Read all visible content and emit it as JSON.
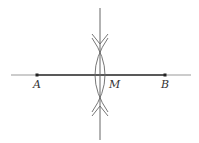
{
  "diagram": {
    "points": [
      {
        "name": "A",
        "label": "A",
        "x": 37,
        "y": 75
      },
      {
        "name": "B",
        "label": "B",
        "x": 165,
        "y": 75
      },
      {
        "name": "M",
        "label": "M",
        "x": 100,
        "y": 75
      }
    ],
    "segment": {
      "from": "A",
      "to": "B"
    },
    "line": {
      "x1": 11,
      "y1": 75,
      "x2": 191,
      "y2": 75
    },
    "bisector": {
      "x": 100,
      "y1": 8,
      "y2": 140
    },
    "arc_intersections": [
      {
        "x": 100,
        "y": 41
      },
      {
        "x": 100,
        "y": 107
      }
    ],
    "colors": {
      "line": "#555555",
      "segment": "#333333",
      "arc": "#666666",
      "label": "#333333"
    }
  }
}
